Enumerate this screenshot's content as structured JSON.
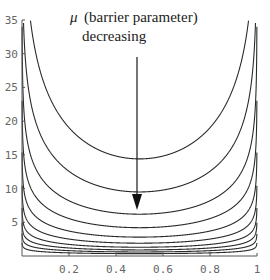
{
  "chart_data": {
    "type": "line",
    "title": "",
    "xlabel": "",
    "ylabel": "",
    "xlim": [
      0,
      1
    ],
    "ylim": [
      0,
      35
    ],
    "grid": false,
    "legend": "none",
    "x_ticks": [
      "0.2",
      "0.4",
      "0.6",
      "0.8",
      "1"
    ],
    "y_ticks": [
      "5",
      "10",
      "15",
      "20",
      "25",
      "30",
      "35"
    ],
    "annotation": {
      "symbol": "μ",
      "line1": "(barrier parameter)",
      "line2": "decreasing",
      "arrow": {
        "x": 0.49,
        "from_y": 29.5,
        "to_y": 7.0
      }
    },
    "curve_description": "Family of U-shaped barrier function curves on (0,1), each of the form m * (-ln x - ln(1-x)) / (2 ln 2) approximately; minima at x=0.5 decrease as μ decreases",
    "series": [
      {
        "name": "mu_1",
        "min_value": 14.4
      },
      {
        "name": "mu_2",
        "min_value": 9.5
      },
      {
        "name": "mu_3",
        "min_value": 6.2
      },
      {
        "name": "mu_4",
        "min_value": 4.2
      },
      {
        "name": "mu_5",
        "min_value": 2.8
      },
      {
        "name": "mu_6",
        "min_value": 1.9
      },
      {
        "name": "mu_7",
        "min_value": 1.3
      },
      {
        "name": "mu_8",
        "min_value": 0.9
      },
      {
        "name": "mu_9",
        "min_value": 0.6
      },
      {
        "name": "mu_10",
        "min_value": 0.35
      }
    ]
  },
  "colors": {
    "curve": "#2a2a2a",
    "axis": "#555555",
    "tick_label": "#666666",
    "background": "#ffffff"
  }
}
